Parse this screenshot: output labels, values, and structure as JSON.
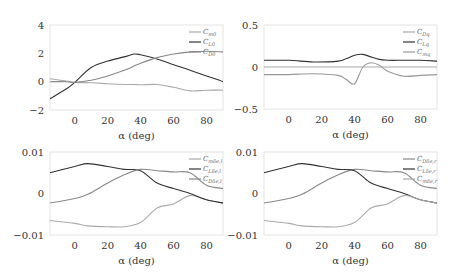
{
  "chart_data": [
    {
      "type": "line",
      "panel": "top-left",
      "xlabel": "α (deg)",
      "ylabel": "",
      "xlim": [
        -15,
        90
      ],
      "ylim": [
        -2,
        4
      ],
      "xticks": [
        "0",
        "20",
        "40",
        "60",
        "80"
      ],
      "yticks": [
        "4",
        "2",
        "0",
        "−2"
      ],
      "legend": [
        "C_m0",
        "C_L0",
        "C_D0"
      ],
      "legend_position": "upper right",
      "grid": false,
      "x": [
        -15,
        -5,
        0,
        10,
        20,
        30,
        36,
        40,
        50,
        60,
        70,
        80,
        90
      ],
      "series": [
        {
          "name": "C_m0",
          "color": "#aaaaaa",
          "values": [
            0.2,
            0.05,
            -0.05,
            -0.08,
            -0.15,
            -0.2,
            -0.2,
            -0.22,
            -0.2,
            -0.4,
            -0.65,
            -0.6,
            -0.6
          ]
        },
        {
          "name": "C_L0",
          "color": "#333333",
          "values": [
            -1.2,
            -0.5,
            -0.05,
            1.0,
            1.45,
            1.75,
            1.95,
            1.9,
            1.6,
            1.2,
            0.8,
            0.4,
            0.0
          ]
        },
        {
          "name": "C_D0",
          "color": "#888888",
          "values": [
            0.0,
            0.0,
            -0.05,
            0.1,
            0.4,
            0.8,
            1.1,
            1.3,
            1.7,
            1.95,
            2.1,
            2.15,
            2.1
          ]
        }
      ]
    },
    {
      "type": "line",
      "panel": "top-right",
      "xlabel": "α (deg)",
      "ylabel": "",
      "xlim": [
        -15,
        90
      ],
      "ylim": [
        -0.5,
        0.5
      ],
      "xticks": [
        "0",
        "20",
        "40",
        "60",
        "80"
      ],
      "yticks": [
        "0.5",
        "0",
        "−0.5"
      ],
      "legend": [
        "C_Dq",
        "C_Lq",
        "C_mq"
      ],
      "legend_position": "upper right",
      "grid": false,
      "x": [
        -15,
        0,
        15,
        30,
        35,
        40,
        45,
        50,
        55,
        60,
        70,
        80,
        90
      ],
      "series": [
        {
          "name": "C_Dq",
          "color": "#aaaaaa",
          "values": [
            0,
            0,
            0,
            0,
            0,
            0,
            0,
            0,
            0,
            0,
            0,
            0,
            0
          ]
        },
        {
          "name": "C_Lq",
          "color": "#333333",
          "values": [
            0.08,
            0.08,
            0.06,
            0.07,
            0.1,
            0.14,
            0.15,
            0.12,
            0.09,
            0.08,
            0.08,
            0.08,
            0.07
          ]
        },
        {
          "name": "C_mq",
          "color": "#999999",
          "values": [
            -0.09,
            -0.09,
            -0.08,
            -0.1,
            -0.15,
            -0.2,
            0.0,
            0.05,
            0.02,
            -0.05,
            -0.11,
            -0.1,
            -0.09
          ]
        }
      ]
    },
    {
      "type": "line",
      "panel": "bottom-left",
      "xlabel": "α (deg)",
      "ylabel": "",
      "xlim": [
        -15,
        90
      ],
      "ylim": [
        -0.01,
        0.01
      ],
      "xticks": [
        "0",
        "20",
        "40",
        "60",
        "80"
      ],
      "yticks": [
        "0.01",
        "0",
        "−0.01"
      ],
      "legend": [
        "C_mδe,l",
        "C_Lδe,l",
        "C_Dδe,l"
      ],
      "legend_position": "upper right",
      "grid": false,
      "x": [
        -15,
        0,
        8,
        20,
        30,
        40,
        50,
        60,
        70,
        80,
        90
      ],
      "series": [
        {
          "name": "C_mδe,l",
          "color": "#aaaaaa",
          "values": [
            -0.0065,
            -0.0072,
            -0.0078,
            -0.008,
            -0.008,
            -0.007,
            -0.0035,
            -0.0025,
            -0.0005,
            -0.0015,
            -0.0023
          ]
        },
        {
          "name": "C_Lδe,l",
          "color": "#333333",
          "values": [
            0.005,
            0.0065,
            0.0072,
            0.0065,
            0.0058,
            0.0055,
            0.0025,
            0.0012,
            0.0,
            -0.0015,
            -0.0023
          ]
        },
        {
          "name": "C_Dδe,l",
          "color": "#888888",
          "values": [
            -0.0023,
            -0.0012,
            -0.0002,
            0.0025,
            0.0045,
            0.0058,
            0.0055,
            0.0052,
            0.005,
            0.002,
            0.0012
          ]
        }
      ]
    },
    {
      "type": "line",
      "panel": "bottom-right",
      "xlabel": "α (deg)",
      "ylabel": "",
      "xlim": [
        -15,
        90
      ],
      "ylim": [
        -0.01,
        0.01
      ],
      "xticks": [
        "0",
        "20",
        "40",
        "60",
        "80"
      ],
      "yticks": [
        "0.01",
        "0",
        "−0.01"
      ],
      "legend": [
        "C_Dδe,r",
        "C_Lδe,r",
        "C_mδe,r"
      ],
      "legend_position": "upper right",
      "grid": false,
      "x": [
        -15,
        0,
        8,
        20,
        30,
        40,
        50,
        60,
        70,
        80,
        90
      ],
      "series": [
        {
          "name": "C_Dδe,r",
          "color": "#888888",
          "values": [
            -0.0023,
            -0.0012,
            -0.0002,
            0.0025,
            0.0045,
            0.0058,
            0.0055,
            0.0052,
            0.005,
            0.002,
            0.0012
          ]
        },
        {
          "name": "C_Lδe,r",
          "color": "#333333",
          "values": [
            0.005,
            0.0065,
            0.0072,
            0.0065,
            0.0058,
            0.0055,
            0.0025,
            0.0012,
            0.0,
            -0.0015,
            -0.0023
          ]
        },
        {
          "name": "C_mδe,r",
          "color": "#aaaaaa",
          "values": [
            -0.0065,
            -0.0072,
            -0.0078,
            -0.008,
            -0.008,
            -0.007,
            -0.0035,
            -0.0025,
            -0.0005,
            -0.0015,
            -0.0023
          ]
        }
      ]
    }
  ],
  "labels": {
    "xlabel": "α (deg)",
    "p1": {
      "yt": [
        "4",
        "2",
        "0",
        "−2"
      ],
      "leg": [
        [
          "C",
          "m0"
        ],
        [
          "C",
          "L0"
        ],
        [
          "C",
          "D0"
        ]
      ]
    },
    "p2": {
      "yt": [
        "0.5",
        "0",
        "−0.5"
      ],
      "leg": [
        [
          "C",
          "Dq"
        ],
        [
          "C",
          "Lq"
        ],
        [
          "C",
          "mq"
        ]
      ]
    },
    "p3": {
      "yt": [
        "0.01",
        "0",
        "−0.01"
      ],
      "leg": [
        [
          "C",
          "mδe,l"
        ],
        [
          "C",
          "Lδe,l"
        ],
        [
          "C",
          "Dδe,l"
        ]
      ]
    },
    "p4": {
      "yt": [
        "0.01",
        "0",
        "−0.01"
      ],
      "leg": [
        [
          "C",
          "Dδe,r"
        ],
        [
          "C",
          "Lδe,r"
        ],
        [
          "C",
          "mδe,r"
        ]
      ]
    },
    "xt": [
      "0",
      "20",
      "40",
      "60",
      "80"
    ]
  }
}
